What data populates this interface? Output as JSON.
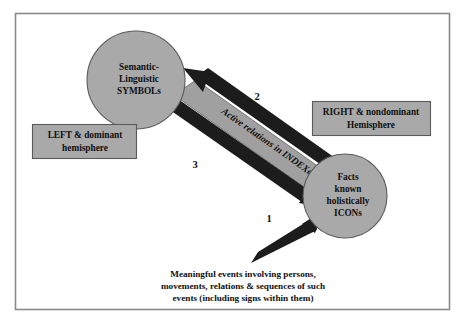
{
  "figure": {
    "frame": {
      "border_color": "#8a8a8a",
      "background_color": "#ffffff"
    },
    "palette": {
      "shape_fill": "#a9a9a9",
      "shape_stroke": "#5a5a5a",
      "band_fill": "#a0a0a0",
      "arrow_color": "#1c1c1c",
      "text_color": "#101010"
    },
    "nodes": [
      {
        "id": "symbols-circle",
        "shape": "circle",
        "lines": [
          "Semantic-",
          "Linguistic",
          "SYMBOLs"
        ],
        "line1": "Semantic-",
        "line2": "Linguistic",
        "line3": "SYMBOLs"
      },
      {
        "id": "icons-circle",
        "shape": "circle",
        "lines": [
          "Facts",
          "known",
          "holistically",
          "ICONs"
        ],
        "line1": "Facts",
        "line2": "known",
        "line3": "holistically",
        "line4": "ICONs"
      },
      {
        "id": "left-hemisphere-box",
        "shape": "rectangle",
        "lines": [
          "LEFT & dominant",
          "hemisphere"
        ],
        "line1": "LEFT & dominant",
        "line2": "hemisphere"
      },
      {
        "id": "right-hemisphere-box",
        "shape": "rectangle",
        "lines": [
          "RIGHT & nondominant",
          "Hemisphere"
        ],
        "line1": "RIGHT & nondominant",
        "line2": "Hemisphere"
      }
    ],
    "band": {
      "label": "Active relations in INDEXes"
    },
    "arrows": [
      {
        "id": "arrow-1",
        "number": "1",
        "direction": "up-right",
        "target": "icons-circle"
      },
      {
        "id": "arrow-2",
        "number": "2",
        "direction": "up-left",
        "target": "symbols-circle"
      },
      {
        "id": "arrow-3",
        "number": "3",
        "direction": "down-right",
        "target": "icons-circle"
      }
    ],
    "caption": {
      "line1": "Meaningful events involving persons,",
      "line2": "movements, relations & sequences of such",
      "line3": "events (including signs within them)"
    }
  }
}
